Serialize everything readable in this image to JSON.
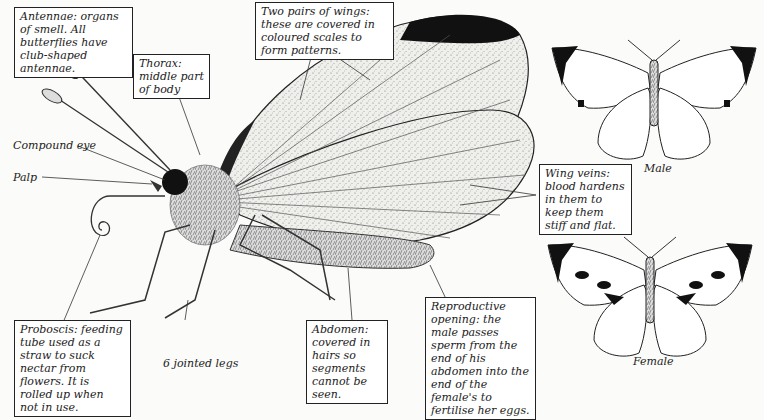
{
  "labels": {
    "antennae": "Antennae: organs of smell. All butterflies have club-shaped antennae.",
    "thorax": "Thorax: middle part of body",
    "wings": "Two pairs of wings: these are covered in coloured scales to form patterns.",
    "compound_eye": "Compound eye",
    "palp": "Palp",
    "wing_veins": "Wing veins: blood hardens in them to keep them stiff and flat.",
    "proboscis": "Proboscis: feeding tube used as a straw to suck nectar from flowers. It is rolled up when not in use.",
    "legs": "6 jointed legs",
    "abdomen": "Abdomen: covered in hairs so segments cannot be seen.",
    "reproductive": "Reproductive opening: the male passes sperm from the end of his abdomen into the end of the female's to fertilise her eggs.",
    "male": "Male",
    "female": "Female"
  }
}
